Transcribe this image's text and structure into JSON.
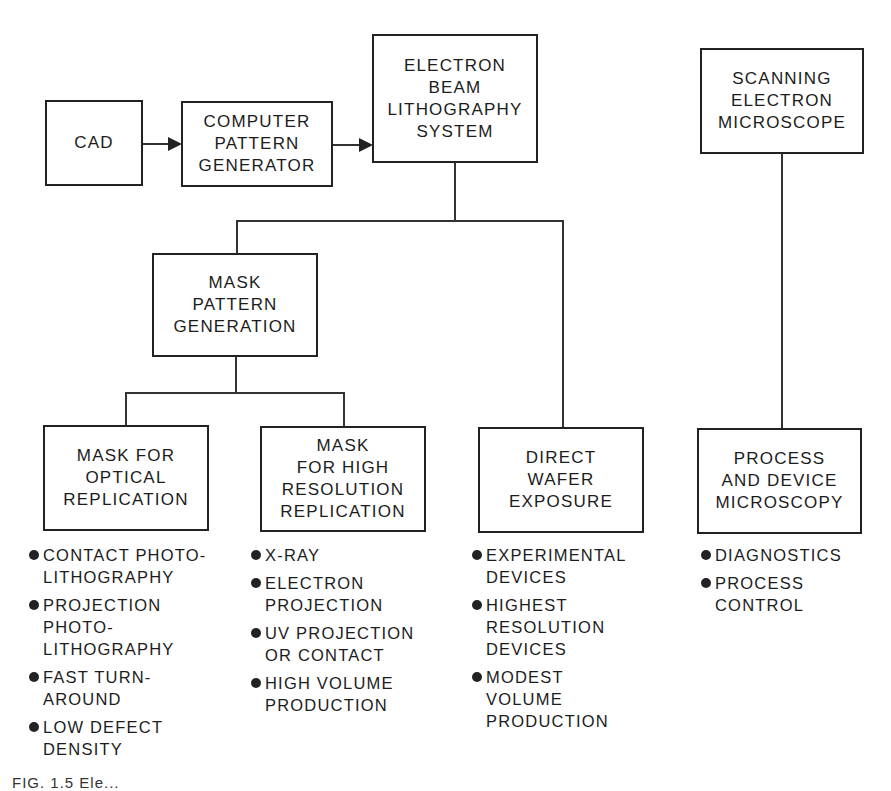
{
  "diagram": {
    "nodes": {
      "cad": {
        "label": "CAD"
      },
      "pattern_generator": {
        "label": "COMPUTER\nPATTERN\nGENERATOR"
      },
      "ebl_system": {
        "label": "ELECTRON\nBEAM\nLITHOGRAPHY\nSYSTEM"
      },
      "sem": {
        "label": "SCANNING\nELECTRON\nMICROSCOPE"
      },
      "mask_pattern_generation": {
        "label": "MASK\nPATTERN\nGENERATION"
      },
      "mask_optical": {
        "label": "MASK FOR\nOPTICAL\nREPLICATION"
      },
      "mask_high_res": {
        "label": "MASK\nFOR HIGH\nRESOLUTION\nREPLICATION"
      },
      "direct_wafer": {
        "label": "DIRECT\nWAFER\nEXPOSURE"
      },
      "process_microscopy": {
        "label": "PROCESS\nAND DEVICE\nMICROSCOPY"
      }
    },
    "edges": [
      {
        "from": "cad",
        "to": "pattern_generator",
        "type": "arrow"
      },
      {
        "from": "pattern_generator",
        "to": "ebl_system",
        "type": "arrow"
      },
      {
        "from": "ebl_system",
        "to": "mask_pattern_generation",
        "type": "line"
      },
      {
        "from": "ebl_system",
        "to": "direct_wafer",
        "type": "line"
      },
      {
        "from": "mask_pattern_generation",
        "to": "mask_optical",
        "type": "line"
      },
      {
        "from": "mask_pattern_generation",
        "to": "mask_high_res",
        "type": "line"
      },
      {
        "from": "sem",
        "to": "process_microscopy",
        "type": "line"
      }
    ],
    "bullets": {
      "mask_optical": [
        "CONTACT PHOTO-\nLITHOGRAPHY",
        "PROJECTION\nPHOTO-\nLITHOGRAPHY",
        "FAST TURN-\nAROUND",
        "LOW DEFECT\nDENSITY"
      ],
      "mask_high_res": [
        "X-RAY",
        "ELECTRON\nPROJECTION",
        "UV PROJECTION\nOR CONTACT",
        "HIGH VOLUME\nPRODUCTION"
      ],
      "direct_wafer": [
        "EXPERIMENTAL\nDEVICES",
        "HIGHEST\nRESOLUTION\nDEVICES",
        "MODEST\nVOLUME\nPRODUCTION"
      ],
      "process_microscopy": [
        "DIAGNOSTICS",
        "PROCESS\nCONTROL"
      ]
    },
    "caption": "FIG. 1.5  Ele..."
  }
}
